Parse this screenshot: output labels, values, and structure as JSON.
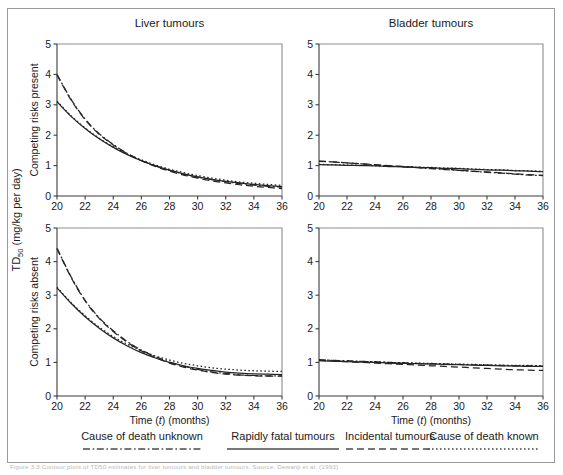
{
  "figure": {
    "panel_titles": [
      "Liver tumours",
      "Bladder tumours"
    ],
    "y_axis_main_label": "TD",
    "y_axis_main_sub": "50",
    "y_axis_main_units": " (mg/kg per day)",
    "row_labels": [
      "Competing risks present",
      "Competing risks absent"
    ],
    "x_axis_label_pre": "Time (",
    "x_axis_label_var": "t",
    "x_axis_label_post": ") (months)",
    "caption": "Figure 3.3 Contour plots of TD50 estimates for liver tumours and bladder tumours. Source: Dewanji et al. (1993)"
  },
  "legend": {
    "items": [
      {
        "label": "Cause of death unknown",
        "style": "dash-dot"
      },
      {
        "label": "Rapidly fatal tumours",
        "style": "solid"
      },
      {
        "label": "Incidental tumours",
        "style": "long-dash"
      },
      {
        "label": "Cause of death known",
        "style": "dotted"
      }
    ]
  },
  "chart_data": {
    "type": "line",
    "xlabel": "Time (t) (months)",
    "ylabel": "TD50 (mg/kg per day)",
    "xlim": [
      20,
      36
    ],
    "ylim": [
      0,
      5
    ],
    "xticks": [
      20,
      22,
      24,
      26,
      28,
      30,
      32,
      34,
      36
    ],
    "yticks": [
      0,
      1,
      2,
      3,
      4,
      5
    ],
    "grid": false,
    "legend_position": "below",
    "panels": [
      {
        "id": "liver-competing-risks-present",
        "column": "Liver tumours",
        "row": "Competing risks present",
        "x": [
          20,
          21,
          22,
          23,
          24,
          25,
          26,
          27,
          28,
          29,
          30,
          31,
          32,
          33,
          34,
          35,
          36
        ],
        "series": [
          {
            "name": "Cause of death unknown",
            "style": "dash-dot",
            "values": [
              4.0,
              3.18,
              2.53,
              2.05,
              1.7,
              1.4,
              1.17,
              0.99,
              0.84,
              0.72,
              0.62,
              0.54,
              0.47,
              0.41,
              0.36,
              0.32,
              0.29
            ]
          },
          {
            "name": "Rapidly fatal tumours",
            "style": "solid",
            "values": [
              3.1,
              2.62,
              2.22,
              1.88,
              1.6,
              1.36,
              1.16,
              0.99,
              0.85,
              0.73,
              0.63,
              0.55,
              0.48,
              0.43,
              0.38,
              0.34,
              0.31
            ]
          },
          {
            "name": "Incidental tumours",
            "style": "long-dash",
            "values": [
              3.98,
              3.16,
              2.51,
              2.03,
              1.68,
              1.39,
              1.16,
              0.97,
              0.82,
              0.69,
              0.59,
              0.5,
              0.43,
              0.37,
              0.32,
              0.28,
              0.24
            ]
          },
          {
            "name": "Cause of death known",
            "style": "dotted",
            "values": [
              3.12,
              2.64,
              2.24,
              1.9,
              1.62,
              1.38,
              1.19,
              1.02,
              0.88,
              0.77,
              0.67,
              0.59,
              0.52,
              0.46,
              0.42,
              0.38,
              0.35
            ]
          }
        ]
      },
      {
        "id": "bladder-competing-risks-present",
        "column": "Bladder tumours",
        "row": "Competing risks present",
        "x": [
          20,
          21,
          22,
          23,
          24,
          25,
          26,
          27,
          28,
          29,
          30,
          31,
          32,
          33,
          34,
          35,
          36
        ],
        "series": [
          {
            "name": "Cause of death unknown",
            "style": "dash-dot",
            "values": [
              1.14,
              1.12,
              1.09,
              1.06,
              1.02,
              0.99,
              0.96,
              0.93,
              0.9,
              0.87,
              0.84,
              0.81,
              0.78,
              0.75,
              0.72,
              0.69,
              0.67
            ]
          },
          {
            "name": "Rapidly fatal tumours",
            "style": "solid",
            "values": [
              1.03,
              1.02,
              1.01,
              1.0,
              0.99,
              0.97,
              0.96,
              0.94,
              0.93,
              0.91,
              0.9,
              0.88,
              0.86,
              0.85,
              0.83,
              0.82,
              0.8
            ]
          },
          {
            "name": "Incidental tumours",
            "style": "long-dash",
            "values": [
              1.15,
              1.12,
              1.09,
              1.06,
              1.03,
              1.0,
              0.97,
              0.94,
              0.91,
              0.88,
              0.85,
              0.82,
              0.79,
              0.76,
              0.73,
              0.7,
              0.68
            ]
          },
          {
            "name": "Cause of death known",
            "style": "dotted",
            "values": [
              1.04,
              1.03,
              1.02,
              1.01,
              1.0,
              0.98,
              0.97,
              0.95,
              0.94,
              0.92,
              0.91,
              0.89,
              0.87,
              0.86,
              0.84,
              0.83,
              0.81
            ]
          }
        ]
      },
      {
        "id": "liver-competing-risks-absent",
        "column": "Liver tumours",
        "row": "Competing risks absent",
        "x": [
          20,
          21,
          22,
          23,
          24,
          25,
          26,
          27,
          28,
          29,
          30,
          31,
          32,
          33,
          34,
          35,
          36
        ],
        "series": [
          {
            "name": "Cause of death unknown",
            "style": "dash-dot",
            "values": [
              4.4,
              3.55,
              2.85,
              2.33,
              1.94,
              1.62,
              1.37,
              1.17,
              1.01,
              0.89,
              0.79,
              0.72,
              0.67,
              0.63,
              0.61,
              0.6,
              0.6
            ]
          },
          {
            "name": "Rapidly fatal tumours",
            "style": "solid",
            "values": [
              3.22,
              2.76,
              2.36,
              2.02,
              1.73,
              1.49,
              1.29,
              1.13,
              1.0,
              0.9,
              0.82,
              0.76,
              0.71,
              0.68,
              0.66,
              0.65,
              0.64
            ]
          },
          {
            "name": "Incidental tumours",
            "style": "long-dash",
            "values": [
              4.38,
              3.53,
              2.83,
              2.31,
              1.92,
              1.6,
              1.34,
              1.14,
              0.98,
              0.86,
              0.77,
              0.7,
              0.65,
              0.62,
              0.6,
              0.59,
              0.59
            ]
          },
          {
            "name": "Cause of death known",
            "style": "dotted",
            "values": [
              3.24,
              2.78,
              2.39,
              2.05,
              1.77,
              1.54,
              1.35,
              1.19,
              1.07,
              0.97,
              0.9,
              0.84,
              0.8,
              0.77,
              0.75,
              0.74,
              0.73
            ]
          }
        ]
      },
      {
        "id": "bladder-competing-risks-absent",
        "column": "Bladder tumours",
        "row": "Competing risks absent",
        "x": [
          20,
          21,
          22,
          23,
          24,
          25,
          26,
          27,
          28,
          29,
          30,
          31,
          32,
          33,
          34,
          35,
          36
        ],
        "series": [
          {
            "name": "Cause of death unknown",
            "style": "dash-dot",
            "values": [
              1.08,
              1.06,
              1.05,
              1.03,
              1.02,
              1.0,
              0.99,
              0.97,
              0.96,
              0.95,
              0.94,
              0.93,
              0.92,
              0.91,
              0.9,
              0.9,
              0.89
            ]
          },
          {
            "name": "Rapidly fatal tumours",
            "style": "solid",
            "values": [
              1.05,
              1.04,
              1.02,
              1.01,
              1.0,
              0.98,
              0.97,
              0.96,
              0.95,
              0.94,
              0.93,
              0.92,
              0.91,
              0.9,
              0.89,
              0.88,
              0.88
            ]
          },
          {
            "name": "Incidental tumours",
            "style": "long-dash",
            "values": [
              1.06,
              1.04,
              1.02,
              1.0,
              0.98,
              0.96,
              0.94,
              0.92,
              0.9,
              0.88,
              0.86,
              0.84,
              0.82,
              0.8,
              0.78,
              0.77,
              0.76
            ]
          },
          {
            "name": "Cause of death known",
            "style": "dotted",
            "values": [
              1.07,
              1.06,
              1.04,
              1.03,
              1.02,
              1.0,
              0.99,
              0.98,
              0.97,
              0.96,
              0.95,
              0.94,
              0.93,
              0.92,
              0.91,
              0.91,
              0.9
            ]
          }
        ]
      }
    ]
  }
}
